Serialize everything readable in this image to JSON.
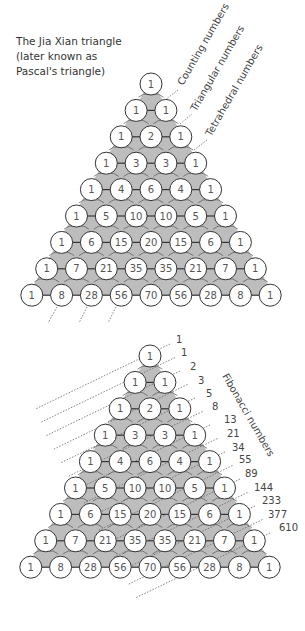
{
  "caption": "The Jia Xian triangle\n(later known as\nPascal's triangle)",
  "rows": [
    [
      1
    ],
    [
      1,
      1
    ],
    [
      1,
      2,
      1
    ],
    [
      1,
      3,
      3,
      1
    ],
    [
      1,
      4,
      6,
      4,
      1
    ],
    [
      1,
      5,
      10,
      10,
      5,
      1
    ],
    [
      1,
      6,
      15,
      20,
      15,
      6,
      1
    ],
    [
      1,
      7,
      21,
      35,
      35,
      21,
      7,
      1
    ],
    [
      1,
      8,
      28,
      56,
      70,
      56,
      28,
      8,
      1
    ]
  ],
  "diagonal_labels": {
    "counting": "Counting numbers",
    "triangular": "Triangular numbers",
    "tetrahedral": "Tetrahedral numbers"
  },
  "fibonacci_label": "Fibonacci numbers",
  "fibonacci_values": [
    1,
    1,
    2,
    3,
    5,
    8,
    13,
    21,
    34,
    55,
    89,
    144,
    233,
    377,
    610
  ],
  "colors": {
    "cell_fill": "#ffffff",
    "cell_stroke": "#333333",
    "hex_fill": "#bdbdbd",
    "text": "#555555",
    "dots": "#666666"
  }
}
